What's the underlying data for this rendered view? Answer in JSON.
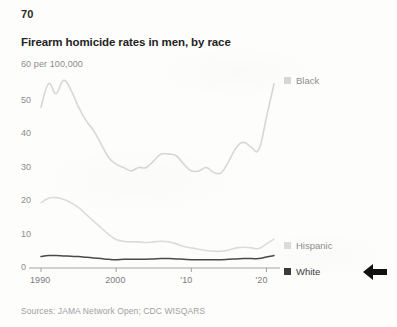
{
  "page": {
    "number": "70",
    "background_color": "#fdfdfc"
  },
  "chart_data": {
    "type": "line",
    "title": "Firearm homicide rates in men, by race",
    "subtitle": "60 per 100,000",
    "units_label": "per 100,000",
    "xlabel": "",
    "ylabel": "per 100,000",
    "xlim": [
      1990,
      2021
    ],
    "ylim": [
      0,
      60
    ],
    "grid": false,
    "legend_position": "right",
    "y_ticks": [
      "0",
      "10",
      "20",
      "30",
      "40",
      "50",
      "60"
    ],
    "y_tick_values": [
      0,
      10,
      20,
      30,
      40,
      50,
      60
    ],
    "x_ticks": [
      "1990",
      "2000",
      "'10",
      "'20"
    ],
    "x_tick_values": [
      1990,
      2000,
      2010,
      2020
    ],
    "x": [
      1990,
      1991,
      1992,
      1993,
      1994,
      1995,
      1996,
      1997,
      1998,
      1999,
      2000,
      2001,
      2002,
      2003,
      2004,
      2005,
      2006,
      2007,
      2008,
      2009,
      2010,
      2011,
      2012,
      2013,
      2014,
      2015,
      2016,
      2017,
      2018,
      2019,
      2020,
      2021
    ],
    "series": [
      {
        "name": "Black",
        "color": "#d7d7d7",
        "values": [
          48.0,
          55.0,
          52.0,
          56.0,
          53.0,
          48.0,
          44.0,
          41.0,
          37.0,
          33.0,
          31.0,
          30.0,
          29.0,
          30.0,
          30.0,
          32.0,
          34.0,
          34.0,
          33.5,
          31.0,
          29.0,
          29.0,
          30.0,
          28.5,
          28.5,
          32.0,
          36.0,
          37.5,
          36.0,
          35.5,
          45.0,
          55.0
        ]
      },
      {
        "name": "Hispanic",
        "color": "#dcdcdc",
        "values": [
          19.5,
          20.8,
          21.0,
          20.5,
          19.5,
          18.0,
          16.0,
          14.0,
          12.0,
          10.0,
          8.5,
          8.0,
          7.8,
          7.8,
          7.6,
          7.8,
          8.0,
          7.8,
          7.2,
          6.4,
          6.0,
          5.6,
          5.2,
          5.0,
          5.0,
          5.4,
          6.0,
          6.2,
          6.0,
          5.8,
          7.2,
          8.6
        ]
      },
      {
        "name": "White",
        "color": "#3a3a3a",
        "values": [
          3.4,
          3.7,
          3.7,
          3.6,
          3.5,
          3.4,
          3.2,
          3.0,
          2.8,
          2.6,
          2.5,
          2.6,
          2.6,
          2.6,
          2.6,
          2.7,
          2.8,
          2.8,
          2.7,
          2.6,
          2.5,
          2.5,
          2.5,
          2.5,
          2.5,
          2.6,
          2.7,
          2.8,
          2.8,
          2.8,
          3.3,
          3.7
        ]
      }
    ],
    "legend": [
      {
        "label": "Black",
        "color": "#d7d7d7"
      },
      {
        "label": "Hispanic",
        "color": "#dcdcdc"
      },
      {
        "label": "White",
        "color": "#3a3a3a"
      }
    ]
  },
  "source_note": "Sources: JAMA Network Open; CDC WISQARS",
  "annotation": {
    "arrow": "left-arrow",
    "color": "#111111"
  }
}
